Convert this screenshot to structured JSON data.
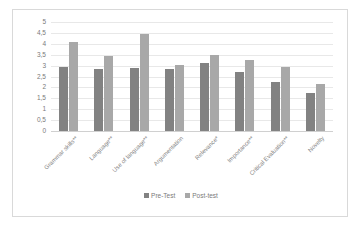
{
  "chart_data": {
    "type": "bar",
    "title": "",
    "subtitle": "",
    "xlabel": "",
    "ylabel": "",
    "ylim": [
      0,
      5
    ],
    "ytick_step": 0.5,
    "ytick_labels": [
      "5",
      "4,5",
      "4",
      "3,5",
      "3",
      "2,5",
      "2",
      "1,5",
      "1",
      "0,5",
      "0"
    ],
    "ytick_values": [
      5,
      4.5,
      4,
      3.5,
      3,
      2.5,
      2,
      1.5,
      1,
      0.5,
      0
    ],
    "decimal_separator": ",",
    "grid": true,
    "grid_axis": "y",
    "legend_position": "bottom",
    "categories": [
      "Grammar skills**",
      "Language**",
      "Use of language**",
      "Argumentation",
      "Relevance*",
      "Importance**",
      "Critical Evaluation**",
      "Novelty"
    ],
    "series": [
      {
        "name": "Pre-Test",
        "color": "#828282",
        "values": [
          2.95,
          2.85,
          2.9,
          2.85,
          3.1,
          2.7,
          2.25,
          1.75
        ]
      },
      {
        "name": "Post-test",
        "color": "#a8a8a8",
        "values": [
          4.1,
          3.45,
          4.45,
          3.03,
          3.48,
          3.28,
          2.95,
          2.15
        ]
      }
    ]
  },
  "style": {
    "plot_background": "#ffffff",
    "frame_border": "#d9d9d9",
    "gridline_color": "#e8e8e8",
    "axis_text_color": "#7a7a7a"
  }
}
